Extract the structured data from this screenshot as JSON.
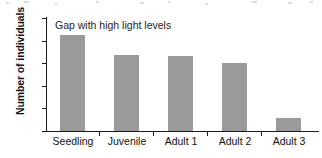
{
  "figure": {
    "name": "population-structure-bar-chart",
    "background_color": "#ffffff",
    "bar_color": "#9a9a9a",
    "axis_color": "#1a1a1a"
  },
  "chart_data": {
    "type": "bar",
    "title": "",
    "xlabel": "",
    "ylabel": "Number of individuals",
    "categories": [
      "Seedling",
      "Juvenile",
      "Adult 1",
      "Adult 2",
      "Adult 3"
    ],
    "values": [
      127,
      101,
      99,
      90,
      17
    ],
    "series": [
      {
        "name": "Gap with high light levels",
        "values": [
          127,
          101,
          99,
          90,
          17
        ]
      }
    ],
    "ylim": [
      0,
      150
    ],
    "yticks": [
      0,
      30,
      60,
      90,
      120,
      150
    ],
    "ytick_labels": [
      "0",
      "30",
      "60",
      "90",
      "120",
      "150"
    ],
    "grid": false,
    "legend": "none",
    "annotations": [
      {
        "text": "Gap with high light levels",
        "position": "top-left-inside-plot"
      }
    ],
    "bar_color": "#9a9a9a"
  }
}
